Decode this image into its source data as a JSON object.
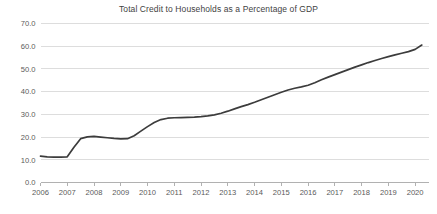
{
  "chart_data": {
    "type": "line",
    "title": "Total Credit to Households as a Percentage of GDP",
    "xlabel": "",
    "ylabel": "",
    "ylim": [
      0.0,
      70.0
    ],
    "yticks": [
      "0.0",
      "10.0",
      "20.0",
      "30.0",
      "40.0",
      "50.0",
      "60.0",
      "70.0"
    ],
    "ytick_values": [
      0.0,
      10.0,
      20.0,
      30.0,
      40.0,
      50.0,
      60.0,
      70.0
    ],
    "xticks": [
      "2006",
      "2007",
      "2008",
      "2009",
      "2010",
      "2011",
      "2012",
      "2013",
      "2014",
      "2015",
      "2016",
      "2017",
      "2018",
      "2019",
      "2020"
    ],
    "xlim": [
      2006.0,
      2020.5
    ],
    "grid": "horizontal",
    "legend": "none",
    "line_color": "#3c3c3c",
    "grid_color": "#d4d4d4",
    "axis_color": "#a8a8a8",
    "label_color": "#5a5a5a",
    "x": [
      2006.0,
      2006.25,
      2006.5,
      2006.75,
      2007.0,
      2007.25,
      2007.5,
      2007.75,
      2008.0,
      2008.25,
      2008.5,
      2008.75,
      2009.0,
      2009.25,
      2009.5,
      2009.75,
      2010.0,
      2010.25,
      2010.5,
      2010.75,
      2011.0,
      2011.25,
      2011.5,
      2011.75,
      2012.0,
      2012.25,
      2012.5,
      2012.75,
      2013.0,
      2013.25,
      2013.5,
      2013.75,
      2014.0,
      2014.25,
      2014.5,
      2014.75,
      2015.0,
      2015.25,
      2015.5,
      2015.75,
      2016.0,
      2016.25,
      2016.5,
      2016.75,
      2017.0,
      2017.25,
      2017.5,
      2017.75,
      2018.0,
      2018.25,
      2018.5,
      2018.75,
      2019.0,
      2019.25,
      2019.5,
      2019.75,
      2020.0,
      2020.25
    ],
    "values": [
      11.6,
      11.3,
      11.2,
      11.2,
      11.3,
      15.5,
      19.3,
      20.1,
      20.3,
      20.0,
      19.7,
      19.4,
      19.2,
      19.3,
      20.6,
      22.6,
      24.6,
      26.4,
      27.7,
      28.3,
      28.5,
      28.6,
      28.7,
      28.8,
      29.0,
      29.3,
      29.8,
      30.5,
      31.4,
      32.4,
      33.4,
      34.3,
      35.3,
      36.4,
      37.5,
      38.6,
      39.7,
      40.7,
      41.5,
      42.1,
      42.8,
      43.9,
      45.2,
      46.4,
      47.5,
      48.6,
      49.7,
      50.8,
      51.8,
      52.8,
      53.7,
      54.6,
      55.4,
      56.2,
      56.9,
      57.6,
      58.6,
      60.5
    ],
    "series": [
      {
        "name": "Total credit to households (% of GDP)",
        "values": [
          11.6,
          11.3,
          11.2,
          11.2,
          11.3,
          15.5,
          19.3,
          20.1,
          20.3,
          20.0,
          19.7,
          19.4,
          19.2,
          19.3,
          20.6,
          22.6,
          24.6,
          26.4,
          27.7,
          28.3,
          28.5,
          28.6,
          28.7,
          28.8,
          29.0,
          29.3,
          29.8,
          30.5,
          31.4,
          32.4,
          33.4,
          34.3,
          35.3,
          36.4,
          37.5,
          38.6,
          39.7,
          40.7,
          41.5,
          42.1,
          42.8,
          43.9,
          45.2,
          46.4,
          47.5,
          48.6,
          49.7,
          50.8,
          51.8,
          52.8,
          53.7,
          54.6,
          55.4,
          56.2,
          56.9,
          57.6,
          58.6,
          60.5
        ]
      }
    ]
  }
}
